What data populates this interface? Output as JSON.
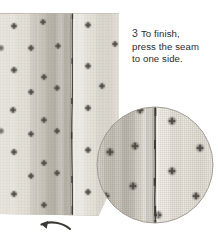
{
  "illustration": {
    "title": "Pressing a seam to one side",
    "subject": "sewn fabric with vertical seam",
    "fabric_color": "#e8e4dc",
    "fabric_shadow_color": "#b9b4ab",
    "seam_color": "#4a4742",
    "motif_color": "#6b6760",
    "motif_name": "woven cross dot",
    "background_color": "#ffffff"
  },
  "instruction": {
    "step_number": "3",
    "text": "To finish,\npress the seam\nto one side.",
    "full_text": "3 To finish, press the seam to one side.",
    "text_color": "#2b2b2b"
  },
  "arrow": {
    "name": "press-direction-arrow",
    "direction": "curves left and points up-left",
    "color": "#3b3835"
  },
  "detail_inset": {
    "name": "magnified-seam-detail",
    "shape": "circle",
    "center_x": 155,
    "center_y": 165,
    "radius": 58,
    "border_color": "#9b968d"
  }
}
